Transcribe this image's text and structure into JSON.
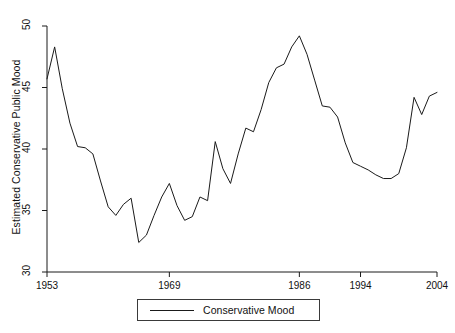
{
  "chart_data": {
    "type": "line",
    "title": "",
    "xlabel": "",
    "ylabel": "Estimated Conservative Public Mood",
    "xlim": [
      1953,
      2004
    ],
    "ylim": [
      30,
      50
    ],
    "grid": false,
    "legend_position": "bottom",
    "xticks": [
      1953,
      1969,
      1986,
      1994,
      2004
    ],
    "xtick_labels": [
      "1953",
      "1969",
      "1986",
      "1994",
      "2004"
    ],
    "yticks": [
      30,
      35,
      40,
      45,
      50
    ],
    "ytick_labels": [
      "30",
      "35",
      "40",
      "45",
      "50"
    ],
    "series": [
      {
        "name": "Conservative Mood",
        "color": "#1a1a1a",
        "x": [
          1953,
          1954,
          1955,
          1956,
          1957,
          1958,
          1959,
          1960,
          1961,
          1962,
          1963,
          1964,
          1965,
          1966,
          1967,
          1968,
          1969,
          1970,
          1971,
          1972,
          1973,
          1974,
          1975,
          1976,
          1977,
          1978,
          1979,
          1980,
          1981,
          1982,
          1983,
          1984,
          1985,
          1986,
          1987,
          1988,
          1989,
          1990,
          1991,
          1992,
          1993,
          1994,
          1995,
          1996,
          1997,
          1998,
          1999,
          2000,
          2001,
          2002,
          2003,
          2004
        ],
        "values": [
          45.7,
          48.3,
          44.9,
          42.1,
          40.2,
          40.1,
          39.6,
          37.4,
          35.3,
          34.6,
          35.5,
          36.0,
          32.4,
          33.0,
          34.6,
          36.1,
          37.2,
          35.4,
          34.2,
          34.5,
          36.1,
          35.8,
          40.6,
          38.4,
          37.2,
          39.6,
          41.7,
          41.4,
          43.2,
          45.4,
          46.6,
          46.9,
          48.3,
          49.2,
          47.7,
          45.6,
          43.5,
          43.4,
          42.6,
          40.5,
          38.9,
          38.6,
          38.3,
          37.9,
          37.6,
          37.6,
          38.0,
          40.1,
          44.2,
          42.8,
          44.3,
          44.6
        ],
        "values_note": "annual estimated conservative public mood"
      }
    ]
  },
  "legend": {
    "label": "Conservative Mood"
  }
}
